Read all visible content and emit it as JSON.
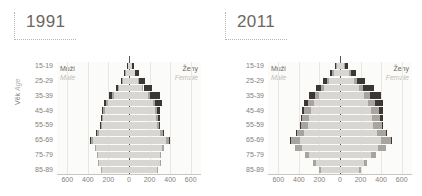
{
  "panels": [
    {
      "year": "1991",
      "axis_title_cz": "Věk",
      "axis_title_en": "Age",
      "legend_male_cz": "Muži",
      "legend_male_en": "Male",
      "legend_female_cz": "Ženy",
      "legend_female_en": "Female"
    },
    {
      "year": "2011",
      "axis_title_cz": "",
      "axis_title_en": "",
      "legend_male_cz": "Muži",
      "legend_male_en": "Male",
      "legend_female_cz": "Ženy",
      "legend_female_en": "Female"
    }
  ],
  "colors": {
    "base": "#d8d6d3",
    "mid": "#a8a5a1",
    "dark": "#3a3734",
    "pale": "#eceae7",
    "axis": "#59544f",
    "grid": "#e8e6e3",
    "text": "#85807a",
    "title": "#6c6761"
  },
  "chart_data": [
    {
      "type": "bar",
      "title": "1991",
      "subtype": "population-pyramid",
      "xlabel": "",
      "ylabel": "Věk / Age",
      "xlim": [
        -700,
        700
      ],
      "xticks": [
        600,
        400,
        200,
        0,
        200,
        400,
        600
      ],
      "grid": true,
      "legend_position": "inside-top-left-and-top-right",
      "age_groups": [
        "85-89",
        "80-84",
        "75-79",
        "70-74",
        "65-69",
        "60-64",
        "55-59",
        "50-54",
        "45-49",
        "40-44",
        "35-39",
        "30-34",
        "25-29",
        "20-24",
        "15-19"
      ],
      "ytick_labels": [
        "85-89",
        "75-79",
        "65-69",
        "55-59",
        "45-49",
        "35-39",
        "25-29",
        "15-19"
      ],
      "series": [
        {
          "name": "Muži / Male",
          "side": "left",
          "base": [
            18,
            38,
            62,
            95,
            150,
            205,
            232,
            248,
            262,
            296,
            352,
            318,
            300,
            298,
            268
          ],
          "mid": [
            2,
            4,
            6,
            9,
            12,
            14,
            16,
            18,
            20,
            26,
            30,
            14,
            10,
            8,
            4
          ],
          "dark": [
            4,
            8,
            14,
            22,
            30,
            24,
            14,
            8,
            4,
            2,
            1,
            0,
            0,
            0,
            0
          ]
        },
        {
          "name": "Ženy / Female",
          "side": "right",
          "base": [
            28,
            56,
            88,
            128,
            186,
            232,
            248,
            258,
            268,
            300,
            356,
            320,
            302,
            300,
            270
          ],
          "mid": [
            3,
            6,
            9,
            13,
            17,
            20,
            22,
            24,
            26,
            30,
            34,
            16,
            11,
            9,
            5
          ],
          "dark": [
            14,
            34,
            60,
            86,
            96,
            66,
            34,
            16,
            7,
            3,
            1,
            0,
            0,
            0,
            0
          ]
        }
      ]
    },
    {
      "type": "bar",
      "title": "2011",
      "subtype": "population-pyramid",
      "xlabel": "",
      "ylabel": "",
      "xlim": [
        -700,
        700
      ],
      "xticks": [
        600,
        400,
        200,
        0,
        200,
        400,
        600
      ],
      "grid": true,
      "legend_position": "inside-top-left-and-top-right",
      "age_groups": [
        "85-89",
        "80-84",
        "75-79",
        "70-74",
        "65-69",
        "60-64",
        "55-59",
        "50-54",
        "45-49",
        "40-44",
        "35-39",
        "30-34",
        "25-29",
        "20-24",
        "15-19"
      ],
      "ytick_labels": [
        "85-89",
        "75-79",
        "65-69",
        "55-59",
        "45-49",
        "35-39",
        "25-29",
        "15-19"
      ],
      "series": [
        {
          "name": "Muži / Male",
          "side": "left",
          "base": [
            30,
            62,
            104,
            152,
            205,
            252,
            286,
            300,
            312,
            348,
            392,
            368,
            300,
            236,
            186
          ],
          "mid": [
            6,
            12,
            20,
            30,
            42,
            56,
            62,
            66,
            70,
            78,
            88,
            70,
            44,
            26,
            16
          ],
          "dark": [
            10,
            22,
            38,
            52,
            54,
            40,
            24,
            14,
            8,
            4,
            2,
            0,
            0,
            0,
            0
          ]
        },
        {
          "name": "Ženy / Female",
          "side": "right",
          "base": [
            42,
            84,
            132,
            182,
            238,
            276,
            302,
            314,
            322,
            356,
            398,
            372,
            304,
            238,
            188
          ],
          "mid": [
            10,
            20,
            32,
            46,
            58,
            68,
            74,
            78,
            82,
            88,
            96,
            76,
            48,
            28,
            17
          ],
          "dark": [
            24,
            52,
            82,
            104,
            100,
            70,
            40,
            22,
            11,
            5,
            2,
            0,
            0,
            0,
            0
          ]
        }
      ]
    }
  ]
}
